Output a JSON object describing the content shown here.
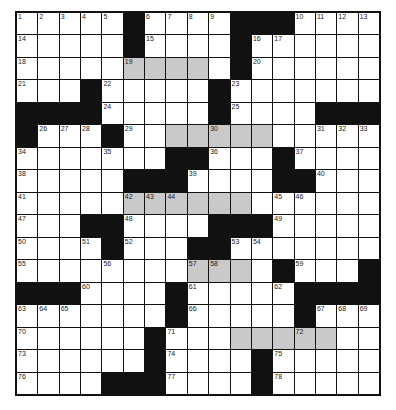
{
  "puzzle": {
    "rows": 17,
    "cols": 17,
    "colors": {
      "block": "#111111",
      "shade": "#c9c9c9",
      "white": "#ffffff"
    },
    "legend": {
      "#": "black",
      ".": "white",
      "s": "shaded"
    },
    "layout": [
      ".....#....###....",
      ".....#....#......",
      ".....ssss.#......",
      "...#.....#.......",
      "####.....#....###",
      "#...#..sssss.....",
      ".......##...#....",
      ".....###....##...",
      ".....ssssss......",
      "...##....###.....",
      "....#...##.......",
      "........sss.#...#",
      "###....#.....####",
      ".......#.....#...",
      "......#...sssss..",
      "......#....#.....",
      "....###....#....."
    ],
    "numbers": {
      "r1": {
        "c1": "1",
        "c2": "2",
        "c3": "3",
        "c4": "4",
        "c5": "5",
        "c7": "6",
        "c8": "7",
        "c9": "8",
        "c10": "9",
        "c14": "10",
        "c15": "11",
        "c16": "12",
        "c17": "13"
      },
      "r2": {
        "c1": "14",
        "c7": "15",
        "c12": "16",
        "c13": "17"
      },
      "r3": {
        "c1": "18",
        "c6": "19",
        "c12": "20"
      },
      "r4": {
        "c1": "21",
        "c5": "22",
        "c11": "23"
      },
      "r5": {
        "c5": "24",
        "c11": "25"
      },
      "r6": {
        "c2": "26",
        "c3": "27",
        "c4": "28",
        "c6": "29",
        "c10": "30",
        "c15": "31",
        "c16": "32",
        "c17": "33"
      },
      "r7": {
        "c1": "34",
        "c5": "35",
        "c10": "36",
        "c14": "37"
      },
      "r8": {
        "c1": "38",
        "c9": "39",
        "c15": "40"
      },
      "r9": {
        "c1": "41",
        "c6": "42",
        "c7": "43",
        "c8": "44",
        "c13": "45",
        "c14": "46"
      },
      "r10": {
        "c1": "47",
        "c6": "48",
        "c13": "49"
      },
      "r11": {
        "c1": "50",
        "c4": "51",
        "c6": "52",
        "c11": "53",
        "c12": "54"
      },
      "r12": {
        "c1": "55",
        "c5": "56",
        "c9": "57",
        "c10": "58",
        "c14": "59"
      },
      "r13": {
        "c4": "60",
        "c9": "61",
        "c13": "62"
      },
      "r14": {
        "c1": "63",
        "c2": "64",
        "c3": "65",
        "c9": "66",
        "c15": "67",
        "c16": "68",
        "c17": "69"
      },
      "r15": {
        "c1": "70",
        "c8": "71",
        "c14": "72"
      },
      "r16": {
        "c1": "73",
        "c8": "74",
        "c13": "75"
      },
      "r17": {
        "c1": "76",
        "c8": "77",
        "c13": "78"
      }
    }
  }
}
